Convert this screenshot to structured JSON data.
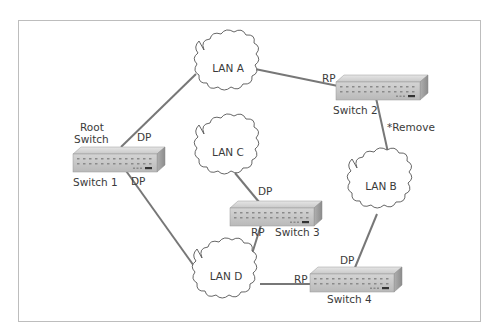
{
  "diagram": {
    "frame": {
      "border_color": "#bdbdbd"
    },
    "colors": {
      "link": "#777777",
      "cloud_stroke": "#555555",
      "switch_top": "#dadada",
      "switch_front": "#c9c9c9",
      "switch_side": "#a9a9a9",
      "text": "#3a3a3a"
    },
    "root_label": {
      "line1": "Root",
      "line2": "Switch"
    },
    "switches": [
      {
        "id": "switch1",
        "label": "Switch 1"
      },
      {
        "id": "switch2",
        "label": "Switch 2"
      },
      {
        "id": "switch3",
        "label": "Switch 3"
      },
      {
        "id": "switch4",
        "label": "Switch 4"
      }
    ],
    "lans": [
      {
        "id": "lanA",
        "label": "LAN A"
      },
      {
        "id": "lanB",
        "label": "LAN B"
      },
      {
        "id": "lanC",
        "label": "LAN C"
      },
      {
        "id": "lanD",
        "label": "LAN D"
      }
    ],
    "port_labels": {
      "sw1_to_lanA": "DP",
      "sw1_to_lanD": "DP",
      "sw2_to_lanA": "RP",
      "sw3_to_lanC": "DP",
      "sw3_to_lanD": "RP",
      "sw4_to_lanD": "RP",
      "sw4_to_lanB": "DP"
    },
    "annotation": {
      "sw2_to_lanB": "*Remove"
    }
  }
}
